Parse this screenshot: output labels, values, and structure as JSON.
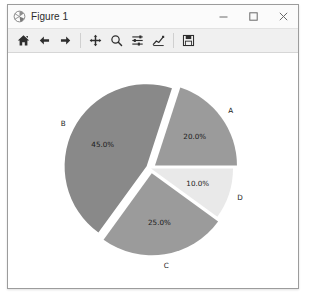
{
  "window": {
    "title": "Figure 1",
    "icon": "matplotlib-icon",
    "controls": {
      "minimize": "minimize-button",
      "maximize": "maximize-button",
      "close": "close-button"
    }
  },
  "toolbar": {
    "items": [
      {
        "name": "home-icon",
        "tooltip": "Home"
      },
      {
        "name": "back-arrow-icon",
        "tooltip": "Back"
      },
      {
        "name": "forward-arrow-icon",
        "tooltip": "Forward"
      },
      {
        "name": "pan-move-icon",
        "tooltip": "Pan"
      },
      {
        "name": "zoom-magnifier-icon",
        "tooltip": "Zoom"
      },
      {
        "name": "configure-sliders-icon",
        "tooltip": "Configure subplots"
      },
      {
        "name": "edit-curve-icon",
        "tooltip": "Edit axis"
      },
      {
        "name": "save-floppy-icon",
        "tooltip": "Save"
      }
    ]
  },
  "chart_data": {
    "type": "pie",
    "title": "",
    "labels": [
      "A",
      "B",
      "C",
      "D"
    ],
    "values": [
      20.0,
      45.0,
      25.0,
      10.0
    ],
    "autopct_labels": [
      "20.0%",
      "45.0%",
      "25.0%",
      "10.0%"
    ],
    "colors": [
      "#9b9b9b",
      "#898989",
      "#9b9b9b",
      "#e9e9e9"
    ],
    "explode": [
      0.06,
      0.06,
      0.06,
      0.0
    ],
    "startangle": 0,
    "counterclock": true,
    "shadow": false,
    "legend": false,
    "label_color": "#1a1a1a",
    "background": "#ffffff",
    "slices": [
      {
        "label": "A",
        "pct": "20.0%",
        "value": 20.0,
        "color": "#9b9b9b",
        "start_deg": 0,
        "end_deg": 72,
        "exploded": true
      },
      {
        "label": "B",
        "pct": "45.0%",
        "value": 45.0,
        "color": "#898989",
        "start_deg": 72,
        "end_deg": 234,
        "exploded": true
      },
      {
        "label": "C",
        "pct": "25.0%",
        "value": 25.0,
        "color": "#9b9b9b",
        "start_deg": 234,
        "end_deg": 324,
        "exploded": true
      },
      {
        "label": "D",
        "pct": "10.0%",
        "value": 10.0,
        "color": "#e9e9e9",
        "start_deg": 324,
        "end_deg": 360,
        "exploded": false
      }
    ]
  }
}
